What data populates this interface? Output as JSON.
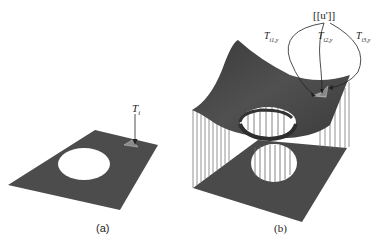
{
  "figure": {
    "panels": [
      {
        "id": "a",
        "caption": "(a)",
        "annotation": "T",
        "annotation_sub": "i"
      },
      {
        "id": "b",
        "caption": "(b)",
        "top_label": "[[u']]",
        "arrow_labels": [
          {
            "main": "T",
            "sub": "i1,y"
          },
          {
            "main": "T",
            "sub": "i2,y"
          },
          {
            "main": "T",
            "sub": "i3,y"
          }
        ]
      }
    ],
    "colors": {
      "surface": "#4a4a4a",
      "surface_dark": "#353535",
      "hole": "#ffffff",
      "lines": "#555555",
      "highlight": "#9a9a9a"
    }
  }
}
